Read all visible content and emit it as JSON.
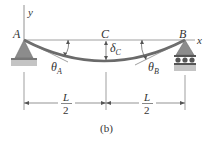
{
  "figure": {
    "caption": "(b)",
    "points": {
      "A": "A",
      "B": "B",
      "C": "C"
    },
    "axes": {
      "x": "x",
      "y": "y"
    },
    "angles": {
      "theta_A": {
        "sym": "θ",
        "sub": "A"
      },
      "theta_B": {
        "sym": "θ",
        "sub": "B"
      }
    },
    "deflection": {
      "sym": "δ",
      "sub": "C"
    },
    "dimensions": {
      "left": {
        "num": "L",
        "den": "2"
      },
      "right": {
        "num": "L",
        "den": "2"
      }
    },
    "supports": {
      "A": "pin-support",
      "B": "roller-support"
    },
    "colors": {
      "beam": "#6a6a6a",
      "support": "#8c8c8c",
      "ground": "#b0b0b0",
      "line": "#555555"
    }
  }
}
